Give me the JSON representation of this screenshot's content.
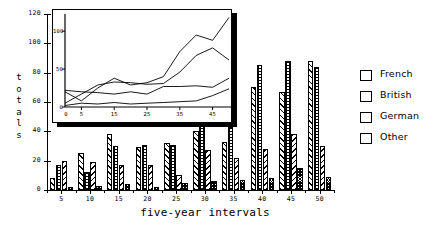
{
  "chart_data": [
    {
      "id": "main-bar-chart",
      "type": "bar",
      "title": "",
      "xlabel": "five-year intervals",
      "ylabel": "totals",
      "categories": [
        "5",
        "10",
        "15",
        "20",
        "25",
        "30",
        "35",
        "40",
        "45",
        "50"
      ],
      "ylim": [
        0,
        120
      ],
      "yticks": [
        0,
        20,
        40,
        60,
        80,
        100,
        120
      ],
      "grid": false,
      "legend_position": "right",
      "series": [
        {
          "name": "French",
          "pattern": "diagonal-forward-hatch",
          "values": [
            8,
            25,
            38,
            29,
            32,
            40,
            33,
            70,
            67,
            88
          ]
        },
        {
          "name": "British",
          "pattern": "crosshatch-grid",
          "values": [
            17,
            12,
            30,
            31,
            31,
            46,
            43,
            85,
            88,
            84
          ]
        },
        {
          "name": "German",
          "pattern": "diagonal-backward-hatch",
          "values": [
            20,
            19,
            17,
            17,
            10,
            27,
            22,
            28,
            38,
            30
          ]
        },
        {
          "name": "Other",
          "pattern": "dense-checker",
          "values": [
            2,
            3,
            4,
            2,
            5,
            6,
            7,
            8,
            15,
            9
          ]
        }
      ]
    },
    {
      "id": "inset-line-chart",
      "type": "line",
      "title": "",
      "xlabel": "",
      "ylabel": "",
      "xlim": [
        0,
        50
      ],
      "ylim": [
        0,
        120
      ],
      "xticks": [
        5,
        15,
        25,
        35,
        45
      ],
      "yticks": [
        0,
        50,
        100
      ],
      "grid": false,
      "legend_position": "none",
      "x": [
        0,
        5,
        10,
        15,
        20,
        25,
        30,
        35,
        40,
        45,
        50
      ],
      "series": [
        {
          "name": "French",
          "values": [
            20,
            8,
            25,
            38,
            29,
            32,
            40,
            73,
            95,
            88,
            118
          ]
        },
        {
          "name": "British",
          "values": [
            5,
            17,
            29,
            33,
            32,
            30,
            31,
            46,
            68,
            78,
            62
          ]
        },
        {
          "name": "German",
          "values": [
            22,
            20,
            19,
            17,
            20,
            17,
            27,
            27,
            28,
            26,
            38
          ]
        },
        {
          "name": "Other",
          "values": [
            2,
            5,
            4,
            6,
            4,
            5,
            6,
            7,
            8,
            15,
            24
          ]
        }
      ]
    }
  ],
  "axes": {
    "y_tick_labels": [
      "0",
      "20",
      "40",
      "60",
      "80",
      "100",
      "120"
    ],
    "x_tick_labels": [
      "5",
      "10",
      "15",
      "20",
      "25",
      "30",
      "35",
      "40",
      "45",
      "50"
    ],
    "y_axis_title_chars": [
      "t",
      "o",
      "t",
      "a",
      "l",
      "s"
    ],
    "x_axis_title": "five-year intervals"
  },
  "inset_axes": {
    "y_tick_labels": [
      "0",
      "50",
      "100"
    ],
    "x_tick_labels": [
      "5",
      "15",
      "25",
      "35",
      "45"
    ]
  },
  "legend": {
    "items": [
      {
        "label": "French",
        "swatch": "diagonal-forward-hatch-swatch"
      },
      {
        "label": "British",
        "swatch": "crosshatch-grid-swatch"
      },
      {
        "label": "German",
        "swatch": "diagonal-backward-hatch-swatch"
      },
      {
        "label": "Other",
        "swatch": "dense-checker-swatch"
      }
    ]
  },
  "colors": {
    "ink": "#000000",
    "background": "#ffffff"
  }
}
